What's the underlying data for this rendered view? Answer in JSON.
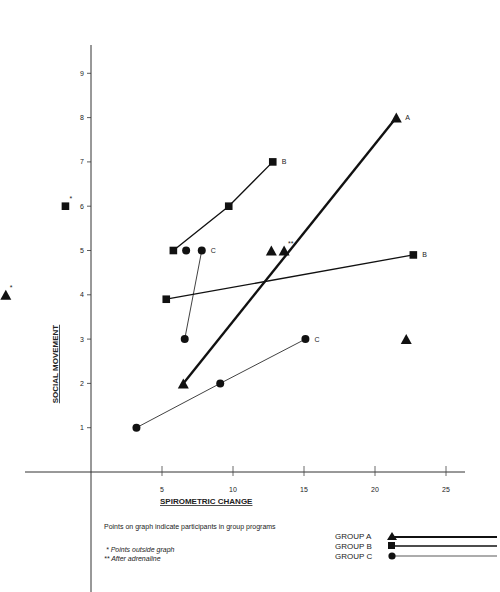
{
  "chart_data": {
    "type": "scatter",
    "title": "",
    "xlabel": "SPIROMETRIC CHANGE",
    "ylabel": "SOCIAL MOVEMENT",
    "xlim": [
      0,
      26
    ],
    "ylim": [
      0,
      9.5
    ],
    "x_ticks": [
      5,
      10,
      15,
      20,
      25
    ],
    "y_ticks": [
      1,
      2,
      3,
      4,
      5,
      6,
      7,
      8,
      9
    ],
    "grid": false,
    "legend_position": "bottom-right",
    "series": [
      {
        "name": "GROUP A",
        "marker": "triangle",
        "line": "thick",
        "lines": [
          [
            [
              6.5,
              2
            ],
            [
              21.5,
              8
            ]
          ]
        ],
        "points": [
          [
            6.5,
            2
          ],
          [
            21.5,
            8
          ],
          [
            12.7,
            5
          ],
          [
            13.6,
            5
          ],
          [
            22.2,
            3
          ],
          [
            -6,
            4
          ]
        ],
        "annotations": [
          {
            "at": [
              21.5,
              8
            ],
            "text": "A"
          },
          {
            "at": [
              13.6,
              5
            ],
            "text": "**"
          },
          {
            "at": [
              -6,
              4
            ],
            "text": "*"
          }
        ]
      },
      {
        "name": "GROUP B",
        "marker": "square",
        "line": "medium",
        "lines": [
          [
            [
              5.8,
              5
            ],
            [
              9.7,
              6
            ],
            [
              12.8,
              7
            ]
          ],
          [
            [
              5.3,
              3.9
            ],
            [
              22.7,
              4.9
            ]
          ]
        ],
        "points": [
          [
            5.8,
            5
          ],
          [
            9.7,
            6
          ],
          [
            12.8,
            7
          ],
          [
            5.3,
            3.9
          ],
          [
            22.7,
            4.9
          ],
          [
            -1.8,
            6
          ]
        ],
        "annotations": [
          {
            "at": [
              12.8,
              7
            ],
            "text": "B"
          },
          {
            "at": [
              22.7,
              4.9
            ],
            "text": "B"
          },
          {
            "at": [
              -1.8,
              6
            ],
            "text": "*"
          }
        ]
      },
      {
        "name": "GROUP C",
        "marker": "circle",
        "line": "thin",
        "lines": [
          [
            [
              6.6,
              3
            ],
            [
              7.8,
              5
            ]
          ],
          [
            [
              3.2,
              1
            ],
            [
              9.1,
              2
            ],
            [
              15.1,
              3
            ]
          ]
        ],
        "points": [
          [
            6.6,
            3
          ],
          [
            7.8,
            5
          ],
          [
            6.7,
            5
          ],
          [
            3.2,
            1
          ],
          [
            9.1,
            2
          ],
          [
            15.1,
            3
          ]
        ],
        "annotations": [
          {
            "at": [
              7.8,
              5
            ],
            "text": "C"
          },
          {
            "at": [
              15.1,
              3
            ],
            "text": "C"
          }
        ]
      }
    ]
  },
  "notes": {
    "main": "Points on graph indicate participants in group programs",
    "single_star": "* Points outside graph",
    "double_star": "** After adrenaline"
  },
  "legend": [
    {
      "label": "GROUP A"
    },
    {
      "label": "GROUP B"
    },
    {
      "label": "GROUP C"
    }
  ]
}
